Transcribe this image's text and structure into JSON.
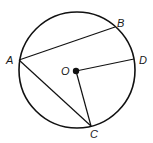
{
  "diagram": {
    "type": "circle-geometry",
    "circle": {
      "cx": 77,
      "cy": 70,
      "r": 58,
      "stroke": "#111111"
    },
    "center": {
      "name": "O",
      "x": 76,
      "y": 71
    },
    "points": {
      "A": {
        "x": 19,
        "y": 60
      },
      "B": {
        "x": 115,
        "y": 27
      },
      "C": {
        "x": 91,
        "y": 126
      },
      "D": {
        "x": 134,
        "y": 59
      }
    },
    "segments": [
      {
        "from": "A",
        "to": "B",
        "kind": "chord"
      },
      {
        "from": "A",
        "to": "C",
        "kind": "chord"
      },
      {
        "from": "O",
        "to": "D",
        "kind": "radius"
      },
      {
        "from": "O",
        "to": "C",
        "kind": "radius"
      }
    ],
    "labels": {
      "A": "A",
      "B": "B",
      "C": "C",
      "D": "D",
      "O": "O"
    }
  }
}
